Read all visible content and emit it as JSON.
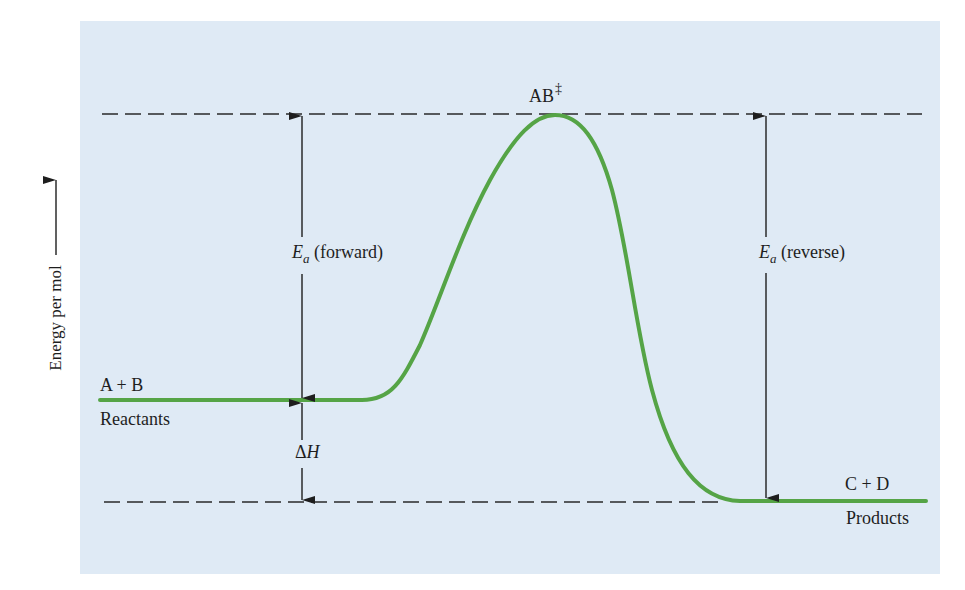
{
  "figure": {
    "type": "reaction-energy-diagram",
    "background_color": "#dfeaf5",
    "curve_color": "#55a446",
    "line_color": "#1e1e1e"
  },
  "axis": {
    "y_label": "Energy per mol",
    "y_arrow": "arrow-up"
  },
  "labels": {
    "reactants_formula": "A + B",
    "reactants_name": "Reactants",
    "products_formula": "C + D",
    "products_name": "Products",
    "transition_state": "AB",
    "transition_state_mark": "‡",
    "ea_symbol": "E",
    "ea_subscript": "a",
    "ea_forward_suffix": " (forward)",
    "ea_reverse_suffix": " (reverse)",
    "delta_symbol": "Δ",
    "enthalpy_symbol": "H"
  },
  "levels": {
    "reactants_energy": "intermediate",
    "transition_state_energy": "maximum",
    "products_energy": "lowest",
    "reaction": "exothermic"
  }
}
